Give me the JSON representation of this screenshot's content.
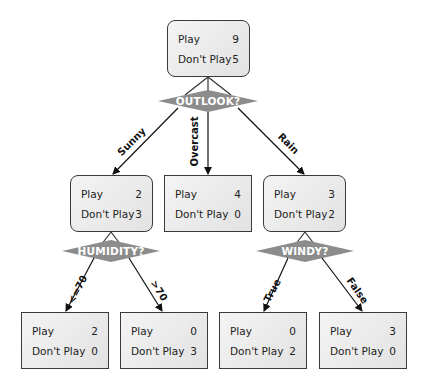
{
  "diagram": {
    "type": "decision-tree",
    "root": {
      "play_label": "Play",
      "play": "9",
      "dont_label": "Don't Play",
      "dont": "5"
    },
    "outlook": {
      "question": "OUTLOOK?",
      "branches": {
        "sunny": {
          "label": "Sunny",
          "play_label": "Play",
          "play": "2",
          "dont_label": "Don't Play",
          "dont": "3"
        },
        "overcast": {
          "label": "Overcast",
          "play_label": "Play",
          "play": "4",
          "dont_label": "Don't Play",
          "dont": "0"
        },
        "rain": {
          "label": "Rain",
          "play_label": "Play",
          "play": "3",
          "dont_label": "Don't Play",
          "dont": "2"
        }
      }
    },
    "humidity": {
      "question": "HUMIDITY?",
      "branches": {
        "le70": {
          "label": "<=70",
          "play_label": "Play",
          "play": "2",
          "dont_label": "Don't Play",
          "dont": "0"
        },
        "gt70": {
          "label": ">70",
          "play_label": "Play",
          "play": "0",
          "dont_label": "Don't Play",
          "dont": "3"
        }
      }
    },
    "windy": {
      "question": "WINDY?",
      "branches": {
        "true": {
          "label": "True",
          "play_label": "Play",
          "play": "0",
          "dont_label": "Don't Play",
          "dont": "2"
        },
        "false": {
          "label": "False",
          "play_label": "Play",
          "play": "3",
          "dont_label": "Don't Play",
          "dont": "0"
        }
      }
    },
    "colors": {
      "diamond": "#8c8c8c",
      "border": "#3a3a3a",
      "box_fill": "#ececec"
    }
  }
}
